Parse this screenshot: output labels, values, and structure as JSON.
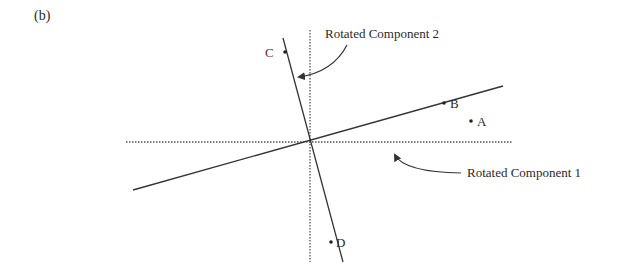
{
  "figure": {
    "panel_label": "(b)",
    "colors": {
      "line": "#333333",
      "axis_dotted": "#555555",
      "text": "#2a2a2a",
      "label_c": "#6a2a2a"
    },
    "axes": {
      "vertical": {
        "x": 310,
        "y1": 30,
        "y2": 262,
        "style": "dotted"
      },
      "horizontal": {
        "y": 142,
        "x1": 126,
        "x2": 512,
        "style": "dotted"
      }
    },
    "components": [
      {
        "name": "Rotated Component 1",
        "x1": 133,
        "y1": 190,
        "x2": 503,
        "y2": 86
      },
      {
        "name": "Rotated Component 2",
        "x1": 283,
        "y1": 38,
        "x2": 343,
        "y2": 262
      }
    ],
    "points": [
      {
        "label": "A",
        "x": 471,
        "y": 121
      },
      {
        "label": "B",
        "x": 444,
        "y": 103
      },
      {
        "label": "C",
        "x": 285,
        "y": 52
      },
      {
        "label": "D",
        "x": 331,
        "y": 242
      }
    ],
    "annotations": {
      "component2_label": "Rotated Component 2",
      "component1_label": "Rotated Component 1"
    }
  }
}
